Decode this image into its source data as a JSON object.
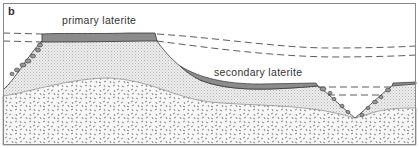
{
  "figure": {
    "panel_label": "b",
    "labels": {
      "primary": "primary laterite",
      "secondary": "secondary laterite"
    },
    "colors": {
      "laterite": "#8c8c8c",
      "saprolite": "#e6e6e6",
      "bedrock_bg": "#f4f4f4",
      "bedrock_marks": "#555555",
      "line": "#333333",
      "border": "#888888"
    }
  }
}
